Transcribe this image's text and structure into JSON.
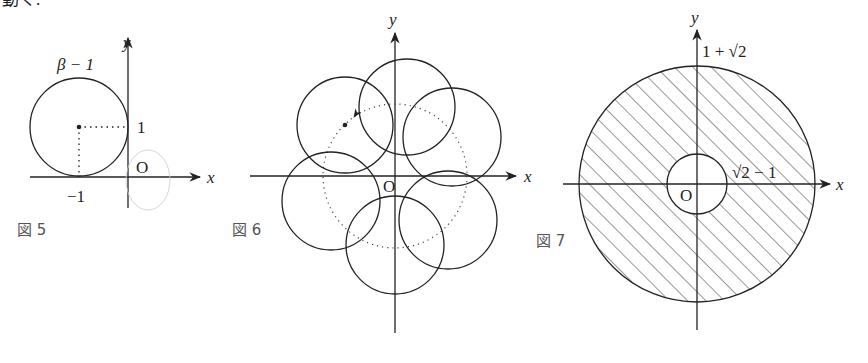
{
  "header_fragment": "動く.",
  "figures": [
    {
      "caption": "図 5",
      "axis_x": "x",
      "axis_y": "y",
      "origin": "O",
      "circle_label": "β − 1",
      "tick_y": "1",
      "tick_x": "−1",
      "description": "Circle of radius 1 centered at (−1, 1), tangent to both axes; center marked with dotted lines to the axes"
    },
    {
      "caption": "図 6",
      "axis_x": "x",
      "axis_y": "y",
      "origin": "O",
      "description": "Six circles whose centers lie on a dotted circle about the origin; an arrow shows the direction of rotation"
    },
    {
      "caption": "図 7",
      "axis_x": "x",
      "axis_y": "y",
      "origin": "O",
      "outer_radius_label": "1 + √2",
      "inner_radius_label": "√2 − 1",
      "description": "Annulus between radii √2 − 1 and 1 + √2, hatched region"
    }
  ]
}
